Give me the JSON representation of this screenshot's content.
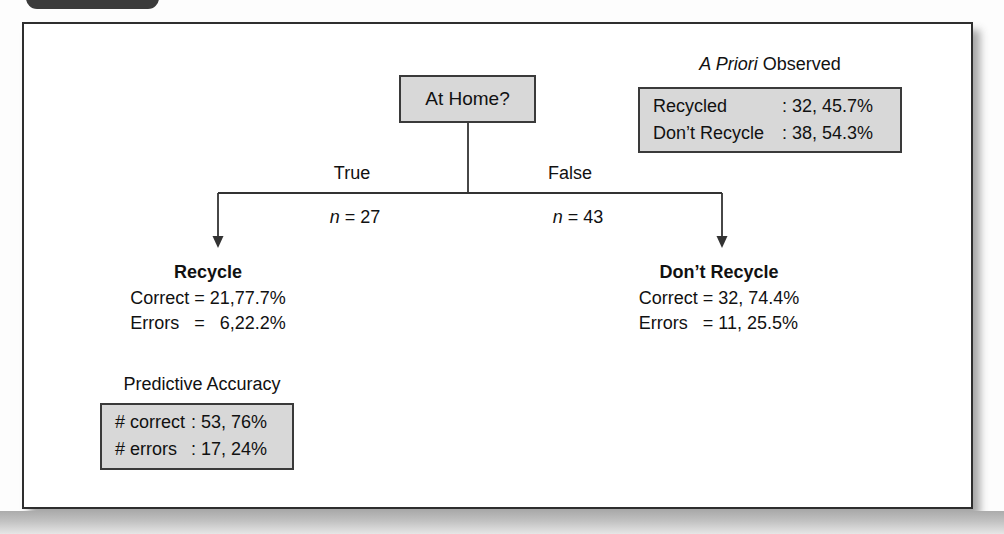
{
  "figure": {
    "root_label": "At Home?",
    "branch_true": {
      "label": "True",
      "n_var": "n",
      "n_rest": " = 27"
    },
    "branch_false": {
      "label": "False",
      "n_var": "n",
      "n_rest": " = 43"
    },
    "leaf_recycle": {
      "title": "Recycle",
      "line_correct": "Correct = 21,77.7%",
      "line_errors": "Errors   =   6,22.2%"
    },
    "leaf_dont_recycle": {
      "title": "Don’t Recycle",
      "line_correct": "Correct = 32, 74.4%",
      "line_errors": "Errors   = 11, 25.5%"
    },
    "a_priori": {
      "title_italic": "A Priori",
      "title_rest": " Observed",
      "rows": [
        {
          "label": "Recycled",
          "value": ": 32, 45.7%"
        },
        {
          "label": "Don’t Recycle",
          "value": ": 38, 54.3%"
        }
      ]
    },
    "predictive": {
      "title": "Predictive Accuracy",
      "rows": [
        {
          "label": "# correct",
          "value": ": 53, 76%"
        },
        {
          "label": "# errors",
          "value": ": 17, 24%"
        }
      ]
    },
    "colors": {
      "node_fill": "#d8d8d8",
      "node_border": "#3a3a3a",
      "connector": "#333333",
      "frame_border": "#2e2e2e"
    }
  }
}
